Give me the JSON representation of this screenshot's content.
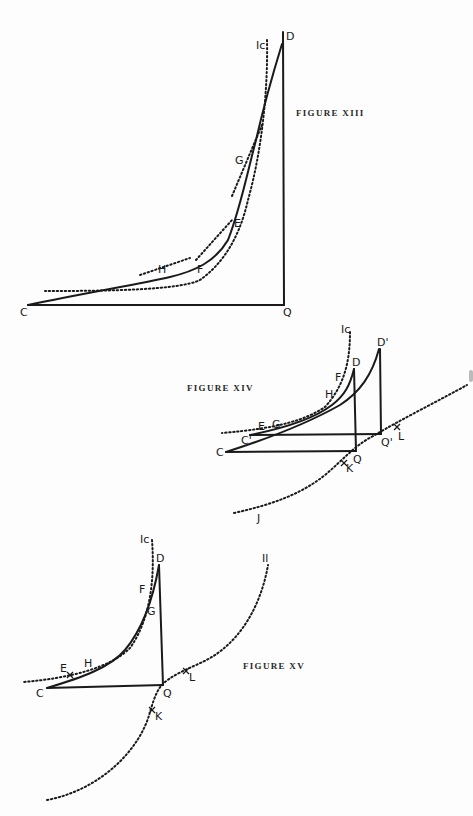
{
  "figures": [
    {
      "title": "FIGURE XIII",
      "points": {
        "C": "C",
        "D": "D",
        "Q": "Q",
        "E": "E",
        "F": "F",
        "G": "G",
        "H": "H"
      },
      "curve_label": "Ic"
    },
    {
      "title": "FIGURE XIV",
      "points": {
        "C": "C",
        "C_prime": "C'",
        "D": "D",
        "D_prime": "D'",
        "Q": "Q",
        "Q_prime": "Q'",
        "E": "E",
        "F": "F",
        "G": "G",
        "H": "H",
        "K": "K",
        "L": "L",
        "J": "J"
      },
      "curve_label": "Ic"
    },
    {
      "title": "FIGURE XV",
      "points": {
        "C": "C",
        "D": "D",
        "Q": "Q",
        "E": "E",
        "F": "F",
        "G": "G",
        "H": "H",
        "K": "K",
        "L": "L"
      },
      "curve_label_left": "Ic",
      "curve_label_right": "Il"
    }
  ]
}
